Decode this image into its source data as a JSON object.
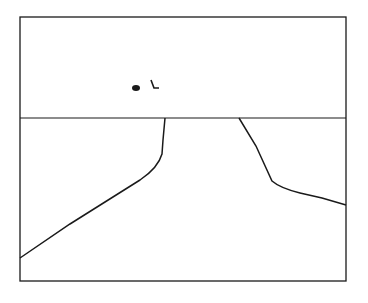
{
  "drawing": {
    "background": "#ffffff",
    "stroke": "#1a1a1a",
    "frame": {
      "x": 20,
      "y": 17,
      "width": 326,
      "height": 264
    },
    "horizon_y": 118,
    "left_path": "M165,118 L163,140 L162,154 Q158,168 140,180 L70,224 L20,258",
    "right_path": "M239,118 L256,146 L272,181 Q280,188 300,193 L322,198 L346,205",
    "objects": [
      {
        "type": "blob",
        "cx": 136,
        "cy": 88,
        "rx": 4,
        "ry": 3
      },
      {
        "type": "mark",
        "path": "M151,80 L154,88 L159,88"
      }
    ]
  }
}
